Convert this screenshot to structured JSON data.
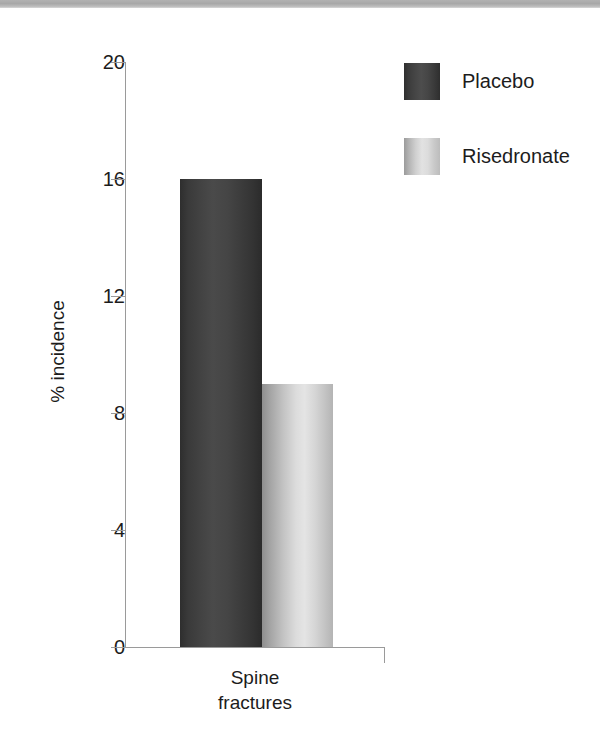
{
  "chart_data": {
    "type": "bar",
    "title": "",
    "subtitle": "",
    "categories": [
      "Spine\nfractures"
    ],
    "category_lines": [
      [
        "Spine",
        "fractures"
      ]
    ],
    "series": [
      {
        "name": "Placebo",
        "values": [
          16
        ],
        "color": "#434343"
      },
      {
        "name": "Risedronate",
        "values": [
          9
        ],
        "color": "#cccccc"
      }
    ],
    "xlabel": "",
    "ylabel": "% incidence",
    "ylim": [
      0,
      20
    ],
    "yticks": [
      0,
      4,
      8,
      12,
      16,
      20
    ],
    "ytick_labels": [
      "0",
      "4",
      "8",
      "12",
      "16",
      "20"
    ],
    "grid": false,
    "legend_position": "top-right"
  },
  "axes": {
    "y_title": "% incidence",
    "ticks": [
      {
        "label": "20",
        "value": 20
      },
      {
        "label": "16",
        "value": 16
      },
      {
        "label": "12",
        "value": 12
      },
      {
        "label": "8",
        "value": 8
      },
      {
        "label": "4",
        "value": 4
      },
      {
        "label": "0",
        "value": 0
      }
    ]
  },
  "category": {
    "line1": "Spine",
    "line2": "fractures"
  },
  "legend": {
    "items": [
      {
        "label": "Placebo",
        "swatch": "dark-gray-gradient-swatch"
      },
      {
        "label": "Risedronate",
        "swatch": "light-gray-gradient-swatch"
      }
    ]
  },
  "colors": {
    "placebo": "#434343",
    "risedronate": "#cccccc",
    "axis": "#9a9a9a",
    "text": "#1c1c1c",
    "top_band": "#b2b2b2",
    "background": "#ffffff"
  }
}
